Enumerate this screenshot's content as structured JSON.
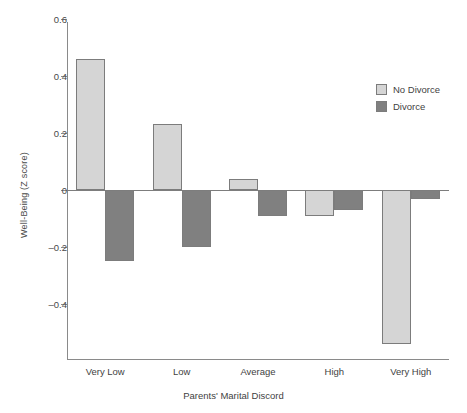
{
  "chart_data": {
    "type": "bar",
    "title": "",
    "xlabel": "Parents' Marital Discord",
    "ylabel": "Well-Being (Z score)",
    "categories": [
      "Very Low",
      "Low",
      "Average",
      "High",
      "Very High"
    ],
    "series": [
      {
        "name": "No Divorce",
        "color": "#d5d5d5",
        "values": [
          0.46,
          0.23,
          0.04,
          -0.09,
          -0.54
        ]
      },
      {
        "name": "Divorce",
        "color": "#808080",
        "values": [
          -0.25,
          -0.2,
          -0.09,
          -0.07,
          -0.03
        ]
      }
    ],
    "ylim": [
      -0.55,
      0.6
    ],
    "yticks": [
      0.6,
      0.4,
      0.2,
      0,
      -0.2,
      -0.4
    ],
    "ytick_labels": [
      "0.6",
      "0.4",
      "0.2",
      "0",
      "–0.2",
      "–0.4"
    ],
    "grid": false,
    "legend_position": "upper right",
    "zero_line": true
  },
  "legend": {
    "items": [
      {
        "label": "No Divorce",
        "color": "#d5d5d5"
      },
      {
        "label": "Divorce",
        "color": "#808080"
      }
    ]
  }
}
